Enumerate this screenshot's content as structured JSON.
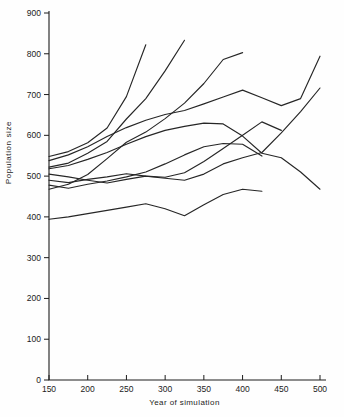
{
  "chart_data": {
    "type": "line",
    "title": "",
    "xlabel": "Year of simulation",
    "ylabel": "Population size",
    "xlim": [
      150,
      500
    ],
    "ylim": [
      0,
      900
    ],
    "xticks": [
      150,
      200,
      250,
      300,
      350,
      400,
      450,
      500
    ],
    "yticks": [
      0,
      100,
      200,
      300,
      400,
      500,
      600,
      700,
      800,
      900
    ],
    "grid": false,
    "legend": "none",
    "line_color": "#262626",
    "axis_color": "#1c1c1c",
    "series": [
      {
        "name": "run-1",
        "points": [
          [
            150,
            548
          ],
          [
            175,
            560
          ],
          [
            200,
            582
          ],
          [
            225,
            618
          ],
          [
            250,
            695
          ],
          [
            275,
            822
          ]
        ]
      },
      {
        "name": "run-2",
        "points": [
          [
            150,
            522
          ],
          [
            175,
            532
          ],
          [
            200,
            556
          ],
          [
            225,
            585
          ],
          [
            250,
            640
          ],
          [
            275,
            690
          ],
          [
            300,
            758
          ],
          [
            325,
            833
          ]
        ]
      },
      {
        "name": "run-3",
        "points": [
          [
            150,
            468
          ],
          [
            175,
            480
          ],
          [
            200,
            504
          ],
          [
            225,
            543
          ],
          [
            250,
            583
          ],
          [
            275,
            608
          ],
          [
            300,
            641
          ],
          [
            325,
            679
          ],
          [
            350,
            727
          ],
          [
            375,
            786
          ],
          [
            400,
            803
          ]
        ]
      },
      {
        "name": "run-4",
        "points": [
          [
            150,
            538
          ],
          [
            175,
            552
          ],
          [
            200,
            572
          ],
          [
            225,
            597
          ],
          [
            250,
            619
          ],
          [
            275,
            637
          ],
          [
            300,
            651
          ],
          [
            325,
            661
          ],
          [
            350,
            677
          ],
          [
            375,
            694
          ],
          [
            400,
            711
          ],
          [
            425,
            692
          ],
          [
            450,
            673
          ],
          [
            475,
            690
          ],
          [
            500,
            794
          ]
        ]
      },
      {
        "name": "run-5",
        "points": [
          [
            150,
            505
          ],
          [
            175,
            498
          ],
          [
            200,
            490
          ],
          [
            225,
            483
          ],
          [
            250,
            492
          ],
          [
            275,
            500
          ],
          [
            300,
            495
          ],
          [
            325,
            490
          ],
          [
            350,
            505
          ],
          [
            375,
            530
          ],
          [
            400,
            545
          ],
          [
            425,
            558
          ],
          [
            450,
            606
          ],
          [
            475,
            658
          ],
          [
            500,
            716
          ]
        ]
      },
      {
        "name": "run-6",
        "points": [
          [
            150,
            518
          ],
          [
            175,
            526
          ],
          [
            200,
            541
          ],
          [
            225,
            558
          ],
          [
            250,
            578
          ],
          [
            275,
            597
          ],
          [
            300,
            612
          ],
          [
            325,
            622
          ],
          [
            350,
            630
          ],
          [
            375,
            628
          ],
          [
            400,
            598
          ],
          [
            425,
            556
          ],
          [
            450,
            545
          ],
          [
            475,
            510
          ],
          [
            500,
            468
          ]
        ]
      },
      {
        "name": "run-7",
        "points": [
          [
            150,
            490
          ],
          [
            175,
            484
          ],
          [
            200,
            492
          ],
          [
            225,
            498
          ],
          [
            250,
            506
          ],
          [
            275,
            500
          ],
          [
            300,
            497
          ],
          [
            325,
            508
          ],
          [
            350,
            536
          ],
          [
            375,
            568
          ],
          [
            400,
            600
          ],
          [
            425,
            633
          ],
          [
            450,
            612
          ]
        ]
      },
      {
        "name": "run-8",
        "points": [
          [
            150,
            478
          ],
          [
            175,
            470
          ],
          [
            200,
            480
          ],
          [
            225,
            488
          ],
          [
            250,
            498
          ],
          [
            275,
            510
          ],
          [
            300,
            530
          ],
          [
            325,
            552
          ],
          [
            350,
            572
          ],
          [
            375,
            580
          ],
          [
            400,
            578
          ],
          [
            425,
            549
          ]
        ]
      },
      {
        "name": "run-9",
        "points": [
          [
            150,
            394
          ],
          [
            175,
            400
          ],
          [
            200,
            408
          ],
          [
            225,
            416
          ],
          [
            250,
            424
          ],
          [
            275,
            432
          ],
          [
            300,
            420
          ],
          [
            325,
            403
          ],
          [
            350,
            430
          ],
          [
            375,
            455
          ],
          [
            400,
            468
          ],
          [
            425,
            463
          ]
        ]
      }
    ]
  }
}
